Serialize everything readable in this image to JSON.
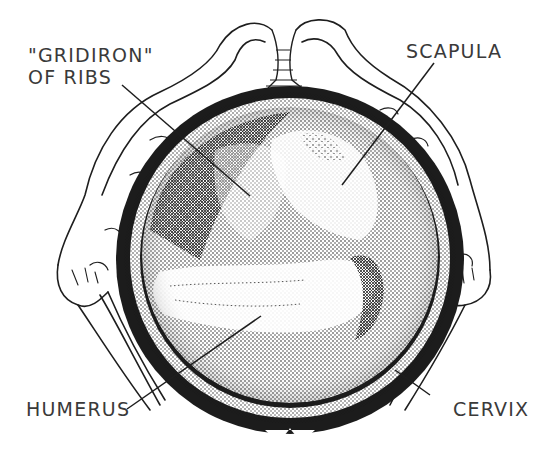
{
  "diagram": {
    "type": "anatomical-illustration",
    "colors": {
      "ink": "#1e1e1e",
      "label_text": "#3a3a3a",
      "background": "#ffffff"
    },
    "labels": [
      {
        "id": "gridiron",
        "line1": "\"GRIDIRON\"",
        "line2": "OF RIBS"
      },
      {
        "id": "scapula",
        "line1": "SCAPULA"
      },
      {
        "id": "humerus",
        "line1": "HUMERUS"
      },
      {
        "id": "cervix",
        "line1": "CERVIX"
      }
    ]
  }
}
